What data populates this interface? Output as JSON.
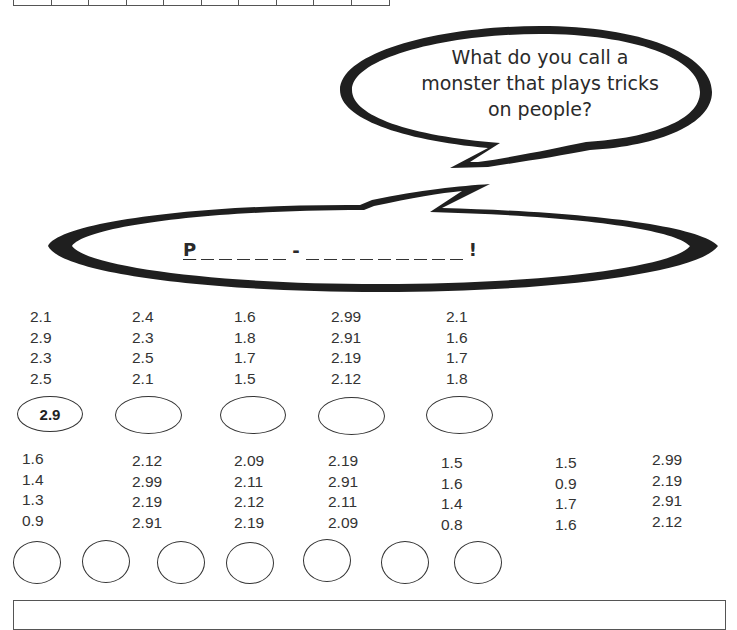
{
  "top_table": {
    "cells": 10
  },
  "question_bubble": {
    "lines": [
      "What do you call a",
      "monster that plays tricks",
      "on people?"
    ]
  },
  "answer_bubble": {
    "first_letter": "P",
    "first_word_blanks": 5,
    "separator": "-",
    "second_word_blanks": 9,
    "end_mark": "!"
  },
  "row1": [
    {
      "numbers": [
        "2.1",
        "2.9",
        "2.3",
        "2.5"
      ],
      "answer": "2.9"
    },
    {
      "numbers": [
        "2.4",
        "2.3",
        "2.5",
        "2.1"
      ],
      "answer": ""
    },
    {
      "numbers": [
        "1.6",
        "1.8",
        "1.7",
        "1.5"
      ],
      "answer": ""
    },
    {
      "numbers": [
        "2.99",
        "2.91",
        "2.19",
        "2.12"
      ],
      "answer": ""
    },
    {
      "numbers": [
        "2.1",
        "1.6",
        "1.7",
        "1.8"
      ],
      "answer": ""
    }
  ],
  "row2": [
    {
      "numbers": [
        "1.6",
        "1.4",
        "1.3",
        "0.9"
      ],
      "answer": ""
    },
    {
      "numbers": [
        "2.12",
        "2.99",
        "2.19",
        "2.91"
      ],
      "answer": ""
    },
    {
      "numbers": [
        "2.09",
        "2.11",
        "2.12",
        "2.19"
      ],
      "answer": ""
    },
    {
      "numbers": [
        "2.19",
        "2.91",
        "2.11",
        "2.09"
      ],
      "answer": ""
    },
    {
      "numbers": [
        "1.5",
        "1.6",
        "1.4",
        "0.8"
      ],
      "answer": ""
    },
    {
      "numbers": [
        "1.5",
        "0.9",
        "1.7",
        "1.6"
      ],
      "answer": ""
    },
    {
      "numbers": [
        "2.99",
        "2.19",
        "2.91",
        "2.12"
      ],
      "answer": ""
    }
  ]
}
